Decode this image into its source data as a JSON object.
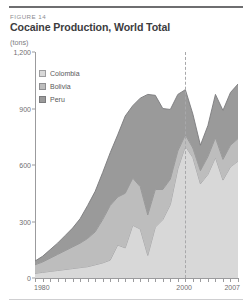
{
  "figure": {
    "label": "FIGURE 14",
    "title": "Cocaine Production, World Total",
    "units": "(tons)"
  },
  "legend": {
    "items": [
      {
        "name": "Colombia",
        "color": "#d8d8d8",
        "stroke": "#9d9d9f"
      },
      {
        "name": "Bolivia",
        "color": "#bdbdbd",
        "stroke": "#8e8e90"
      },
      {
        "name": "Peru",
        "color": "#9a9a9a",
        "stroke": "#7b7b7d"
      }
    ]
  },
  "axes": {
    "y_ticks": [
      "1,200",
      "900",
      "600",
      "300",
      "0"
    ],
    "y_values": [
      1200,
      900,
      600,
      300,
      0
    ],
    "y_min": 0,
    "y_max": 1200,
    "x_labels": [
      {
        "text": "1980",
        "year": 1980
      },
      {
        "text": "2000",
        "year": 2000
      },
      {
        "text": "2007",
        "year": 2007
      }
    ],
    "x_min": 1980,
    "x_max": 2007
  },
  "annotations": {
    "reference_line_year": 2000
  },
  "chart_data": {
    "type": "area",
    "stacked": true,
    "title": "Cocaine Production, World Total",
    "subtitle": "FIGURE 14",
    "xlabel": "",
    "ylabel": "tons",
    "ylim": [
      0,
      1200
    ],
    "xlim": [
      1980,
      2007
    ],
    "grid": false,
    "legend_position": "upper-left inside plot",
    "reference_lines": [
      {
        "x": 2000,
        "style": "dashed"
      }
    ],
    "x": [
      1980,
      1981,
      1982,
      1983,
      1984,
      1985,
      1986,
      1987,
      1988,
      1989,
      1990,
      1991,
      1992,
      1993,
      1994,
      1995,
      1996,
      1997,
      1998,
      1999,
      2000,
      2001,
      2002,
      2003,
      2004,
      2005,
      2006,
      2007
    ],
    "series": [
      {
        "name": "Peru",
        "color": "#9a9a9a",
        "values": [
          20,
          30,
          45,
          60,
          80,
          100,
          130,
          175,
          215,
          250,
          280,
          330,
          410,
          385,
          470,
          640,
          500,
          430,
          370,
          300,
          240,
          180,
          135,
          165,
          230,
          260,
          280,
          290
        ]
      },
      {
        "name": "Bolivia",
        "color": "#bdbdbd",
        "values": [
          45,
          55,
          70,
          85,
          100,
          115,
          130,
          150,
          175,
          230,
          290,
          255,
          290,
          250,
          225,
          215,
          200,
          160,
          135,
          95,
          60,
          50,
          70,
          95,
          105,
          110,
          115,
          120
        ]
      },
      {
        "name": "Colombia",
        "color": "#d8d8d8",
        "values": [
          25,
          30,
          35,
          40,
          45,
          50,
          55,
          60,
          70,
          80,
          95,
          175,
          160,
          280,
          260,
          120,
          270,
          310,
          390,
          580,
          700,
          640,
          500,
          550,
          640,
          520,
          590,
          620
        ]
      }
    ],
    "totals": [
      90,
      115,
      150,
      185,
      225,
      265,
      315,
      385,
      460,
      560,
      665,
      760,
      860,
      915,
      955,
      975,
      970,
      900,
      895,
      975,
      1000,
      870,
      705,
      810,
      975,
      890,
      985,
      1030
    ]
  }
}
